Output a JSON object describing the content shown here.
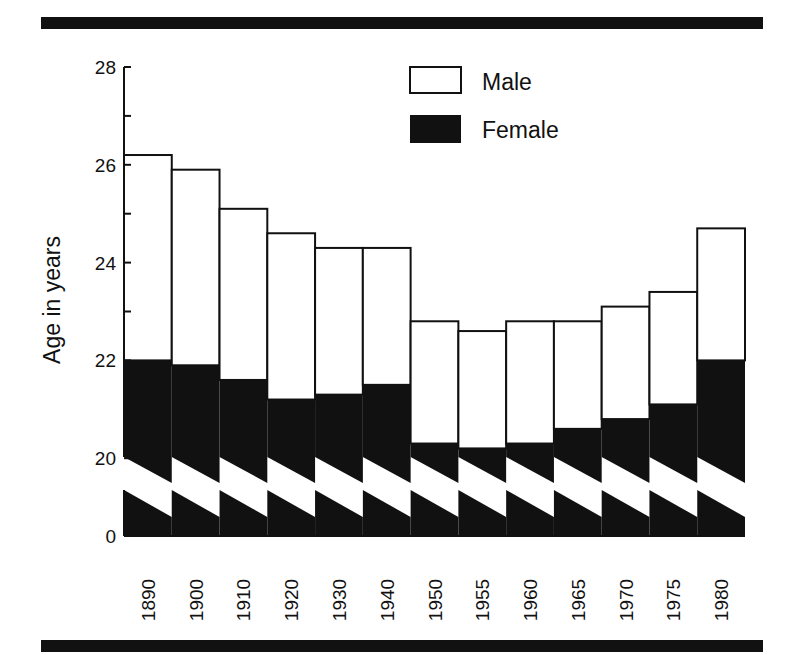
{
  "chart_data": {
    "type": "bar",
    "title": "",
    "xlabel": "",
    "ylabel": "Age in years",
    "ylim": [
      20,
      28
    ],
    "axis_break": {
      "from": 0,
      "to": 20
    },
    "y_ticks": [
      0,
      20,
      22,
      24,
      26,
      28
    ],
    "y_minor_ticks": [
      21,
      23,
      25,
      27
    ],
    "grid": false,
    "legend_position": "top-right",
    "categories": [
      "1890",
      "1900",
      "1910",
      "1920",
      "1930",
      "1940",
      "1950",
      "1955",
      "1960",
      "1965",
      "1970",
      "1975",
      "1980"
    ],
    "series": [
      {
        "name": "Male",
        "color": "#ffffff",
        "values": [
          26.2,
          25.9,
          25.1,
          24.6,
          24.3,
          24.3,
          22.8,
          22.6,
          22.8,
          22.8,
          23.1,
          23.4,
          24.7
        ]
      },
      {
        "name": "Female",
        "color": "#111111",
        "values": [
          22.0,
          21.9,
          21.6,
          21.2,
          21.3,
          21.5,
          20.3,
          20.2,
          20.3,
          20.6,
          20.8,
          21.1,
          22.0
        ]
      }
    ]
  }
}
